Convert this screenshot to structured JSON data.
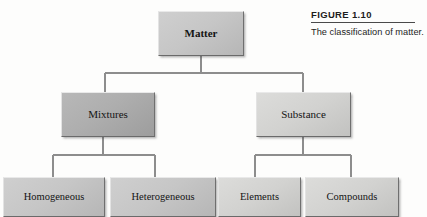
{
  "caption": {
    "figure_label": "FIGURE 1.10",
    "description": "The classification of matter."
  },
  "diagram": {
    "type": "tree",
    "title": "The classification of matter",
    "root": "Matter",
    "nodes": [
      {
        "id": "matter",
        "label": "Matter",
        "level": 0,
        "shade": "mid",
        "bold": true,
        "parent": null
      },
      {
        "id": "mixtures",
        "label": "Mixtures",
        "level": 1,
        "shade": "dark",
        "bold": false,
        "parent": "matter"
      },
      {
        "id": "substance",
        "label": "Substance",
        "level": 1,
        "shade": "light",
        "bold": false,
        "parent": "matter"
      },
      {
        "id": "homogeneous",
        "label": "Homogeneous",
        "level": 2,
        "shade": "mid",
        "bold": false,
        "parent": "mixtures"
      },
      {
        "id": "heterogeneous",
        "label": "Heterogeneous",
        "level": 2,
        "shade": "mid",
        "bold": false,
        "parent": "mixtures"
      },
      {
        "id": "elements",
        "label": "Elements",
        "level": 2,
        "shade": "light",
        "bold": false,
        "parent": "substance"
      },
      {
        "id": "compounds",
        "label": "Compounds",
        "level": 2,
        "shade": "light",
        "bold": false,
        "parent": "substance"
      }
    ],
    "colors": {
      "box_dark": "#adadad",
      "box_mid": "#c6c6c6",
      "box_light": "#d2d2d0",
      "connector": "#8a8a8a",
      "text": "#141414",
      "background": "#fdfdfc"
    }
  }
}
